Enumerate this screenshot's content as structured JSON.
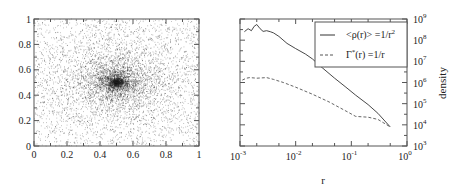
{
  "figure": {
    "left_panel": {
      "x_ticks": [
        "0",
        "0.2",
        "0.4",
        "0.6",
        "0.8",
        "1"
      ],
      "y_ticks": [
        "0",
        "0.2",
        "0.4",
        "0.6",
        "0.8",
        "1"
      ]
    },
    "right_panel": {
      "x_ticks": [
        {
          "base": "10",
          "exp": "-3"
        },
        {
          "base": "10",
          "exp": "-2"
        },
        {
          "base": "10",
          "exp": "-1"
        },
        {
          "base": "10",
          "exp": "0"
        }
      ],
      "y_ticks": [
        {
          "base": "10",
          "exp": "3"
        },
        {
          "base": "10",
          "exp": "4"
        },
        {
          "base": "10",
          "exp": "5"
        },
        {
          "base": "10",
          "exp": "6"
        },
        {
          "base": "10",
          "exp": "7"
        },
        {
          "base": "10",
          "exp": "8"
        },
        {
          "base": "10",
          "exp": "9"
        }
      ],
      "xlabel": "r",
      "ylabel": "density",
      "legend": [
        {
          "label_main": "<ρ(r)> =1/r",
          "label_sup": "2",
          "style": "solid"
        },
        {
          "label_main": "Γ",
          "label_star": "*",
          "label_rest": "(r) =1/r",
          "style": "dashed"
        }
      ]
    }
  },
  "chart_data": [
    {
      "type": "scatter",
      "title": "",
      "xlabel": "",
      "ylabel": "",
      "xlim": [
        0,
        1
      ],
      "ylim": [
        0,
        1
      ],
      "grid": false,
      "description": "Dense 2D point cloud centered at (0.5, 0.5), concentrated core with power-law falloff",
      "center": [
        0.5,
        0.5
      ],
      "n_points_approx": 9000,
      "x_ticks": [
        0,
        0.2,
        0.4,
        0.6,
        0.8,
        1
      ],
      "y_ticks": [
        0,
        0.2,
        0.4,
        0.6,
        0.8,
        1
      ]
    },
    {
      "type": "line",
      "title": "",
      "xlabel": "r",
      "ylabel": "density",
      "xscale": "log",
      "yscale": "log",
      "xlim": [
        0.001,
        1
      ],
      "ylim": [
        1000,
        1000000000
      ],
      "legend_position": "upper right",
      "grid": false,
      "series": [
        {
          "name": "<ρ(r)> =1/r²",
          "style": "solid",
          "x": [
            0.0012,
            0.0014,
            0.0016,
            0.0018,
            0.002,
            0.0023,
            0.0026,
            0.003,
            0.0035,
            0.004,
            0.005,
            0.007,
            0.01,
            0.015,
            0.02,
            0.03,
            0.05,
            0.08,
            0.12,
            0.2,
            0.3,
            0.5
          ],
          "y": [
            250000000.0,
            350000000.0,
            280000000.0,
            450000000.0,
            550000000.0,
            350000000.0,
            260000000.0,
            280000000.0,
            250000000.0,
            220000000.0,
            150000000.0,
            70000000.0,
            40000000.0,
            22000000.0,
            13000000.0,
            5000000.0,
            1600000.0,
            600000.0,
            250000.0,
            90000.0,
            35000.0,
            8000.0
          ]
        },
        {
          "name": "Γ*(r) =1/r",
          "style": "dashed",
          "x": [
            0.0011,
            0.0013,
            0.0015,
            0.002,
            0.003,
            0.004,
            0.006,
            0.01,
            0.02,
            0.04,
            0.08,
            0.12,
            0.2,
            0.3,
            0.5
          ],
          "y": [
            1300000.0,
            1600000.0,
            1700000.0,
            1600000.0,
            1700000.0,
            1400000.0,
            1000000.0,
            600000.0,
            280000.0,
            120000.0,
            45000.0,
            25000.0,
            23000.0,
            18000.0,
            8000.0
          ]
        }
      ]
    }
  ]
}
